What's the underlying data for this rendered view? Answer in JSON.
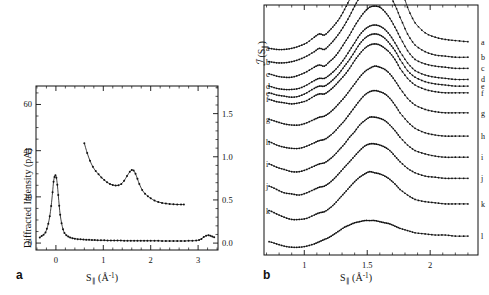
{
  "figure": {
    "panels": [
      {
        "letter": "a",
        "xlabel_main": "S",
        "xlabel_sub": "∥",
        "xlabel_unit_open": " (Å",
        "xlabel_unit_sup": "-1",
        "xlabel_unit_close": ")",
        "ylabel_left": "Diffracted Intensity (pA)",
        "xticks": [
          "0",
          "1",
          "2",
          "3"
        ],
        "yticks_left": [
          "0",
          "20",
          "40",
          "60"
        ],
        "yticks_right": [
          "0.0",
          "0.5",
          "1.0",
          "1.5"
        ]
      },
      {
        "letter": "b",
        "xlabel_main": "S",
        "xlabel_sub": "∥",
        "xlabel_unit_open": " (Å",
        "xlabel_unit_sup": "-1",
        "xlabel_unit_close": ")",
        "ylabel_main": "ℐ",
        "ylabel_arg_open": " (S",
        "ylabel_arg_sub": "∥",
        "ylabel_arg_close": ")",
        "xticks": [
          "1",
          "1.5",
          "2"
        ],
        "curve_labels": [
          "a",
          "b",
          "c",
          "d",
          "e",
          "f",
          "g",
          "h",
          "i",
          "j",
          "k",
          "l"
        ]
      }
    ],
    "colors": {
      "ink": "#111111",
      "background": "#ffffff"
    }
  },
  "chart_data": [
    {
      "type": "line",
      "panel": "a",
      "title": "",
      "xlabel": "S_par (A^-1)",
      "ylabel": "Diffracted Intensity (pA)",
      "ylabel_right": "Diffracted Intensity (arb.)",
      "xlim": [
        -0.42,
        3.42
      ],
      "ylim": [
        -3,
        68
      ],
      "ylim_right": [
        -0.08,
        1.82
      ],
      "xticks": [
        0,
        1,
        2,
        3
      ],
      "yticks": [
        0,
        20,
        40,
        60
      ],
      "yticks_right": [
        0.0,
        0.5,
        1.0,
        1.5
      ],
      "grid": false,
      "legend": "none",
      "markers": "filled-dot",
      "series": [
        {
          "name": "specular-scan-low",
          "axis": "left",
          "x": [
            -0.34,
            -0.3,
            -0.26,
            -0.22,
            -0.19,
            -0.16,
            -0.13,
            -0.1,
            -0.07,
            -0.05,
            -0.03,
            -0.01,
            0.01,
            0.03,
            0.05,
            0.07,
            0.09,
            0.12,
            0.15,
            0.18,
            0.22,
            0.26,
            0.3,
            0.35,
            0.4,
            0.46,
            0.52,
            0.58,
            0.64,
            0.7,
            0.76,
            0.82,
            0.88,
            0.95,
            1.02,
            1.09,
            1.16,
            1.23,
            1.3,
            1.37,
            1.44,
            1.51,
            1.58,
            1.65,
            1.72,
            1.79,
            1.86,
            1.93,
            2.0,
            2.08,
            2.16,
            2.24,
            2.32,
            2.4,
            2.48,
            2.56,
            2.64,
            2.72,
            2.8,
            2.88,
            2.96,
            3.02,
            3.07,
            3.12,
            3.17,
            3.22,
            3.26,
            3.3,
            3.34
          ],
          "y": [
            2.4,
            3.1,
            3.6,
            4.6,
            6.2,
            8.4,
            11.6,
            16.1,
            22.0,
            26.5,
            28.6,
            29.4,
            28.3,
            25.3,
            20.8,
            16.2,
            12.3,
            8.6,
            6.0,
            4.4,
            3.4,
            2.8,
            2.4,
            2.1,
            1.9,
            1.7,
            1.6,
            1.5,
            1.4,
            1.4,
            1.3,
            1.3,
            1.2,
            1.2,
            1.2,
            1.1,
            1.1,
            1.1,
            1.1,
            1.1,
            1.0,
            1.0,
            1.0,
            1.0,
            1.0,
            1.0,
            1.0,
            1.0,
            1.0,
            1.0,
            1.0,
            0.9,
            0.9,
            0.9,
            0.9,
            0.9,
            0.9,
            0.9,
            1.0,
            1.0,
            1.1,
            1.3,
            1.8,
            2.6,
            3.2,
            3.4,
            3.2,
            2.8,
            2.5
          ]
        },
        {
          "name": "diffuse-scan-high",
          "axis": "right",
          "x": [
            0.6,
            0.66,
            0.72,
            0.78,
            0.84,
            0.9,
            0.96,
            1.02,
            1.08,
            1.14,
            1.2,
            1.26,
            1.32,
            1.38,
            1.44,
            1.5,
            1.56,
            1.6,
            1.64,
            1.68,
            1.72,
            1.76,
            1.82,
            1.88,
            1.94,
            2.0,
            2.08,
            2.16,
            2.24,
            2.32,
            2.4,
            2.48,
            2.56,
            2.64,
            2.7
          ],
          "y_pA_equiv": [
            43.2,
            39.0,
            35.6,
            33.0,
            31.2,
            29.8,
            28.4,
            27.3,
            26.3,
            25.6,
            25.1,
            24.9,
            25.0,
            25.6,
            27.0,
            29.0,
            30.9,
            31.6,
            31.4,
            30.0,
            27.8,
            25.6,
            23.0,
            21.4,
            20.3,
            19.4,
            18.4,
            17.8,
            17.4,
            17.1,
            16.9,
            16.8,
            16.7,
            16.7,
            16.7
          ]
        }
      ]
    },
    {
      "type": "line",
      "panel": "b",
      "title": "",
      "xlabel": "S_par (A^-1)",
      "ylabel": "I(S_par)",
      "xlim": [
        0.68,
        2.38
      ],
      "ylim": [
        -0.1,
        2.15
      ],
      "xticks": [
        1,
        1.5,
        2
      ],
      "grid": false,
      "legend": "right-of-curve-ends",
      "markers": "filled-dot",
      "note": "Twelve vertically-offset structure-factor curves a(top) through l(bottom); each has a broad peak near S=1.55-1.68.",
      "x": [
        0.72,
        0.78,
        0.84,
        0.9,
        0.96,
        1.02,
        1.08,
        1.12,
        1.16,
        1.2,
        1.24,
        1.28,
        1.32,
        1.36,
        1.4,
        1.44,
        1.48,
        1.52,
        1.56,
        1.6,
        1.64,
        1.68,
        1.72,
        1.76,
        1.82,
        1.88,
        1.96,
        2.04,
        2.12,
        2.2,
        2.3
      ],
      "series": [
        {
          "name": "a",
          "offset": 1.72,
          "peak_x": 1.67,
          "peak_height": 0.92,
          "values": [
            1.76,
            1.75,
            1.75,
            1.76,
            1.78,
            1.81,
            1.86,
            1.89,
            1.88,
            1.92,
            1.97,
            2.03,
            2.11,
            2.2,
            2.3,
            2.4,
            2.5,
            2.58,
            2.63,
            2.65,
            2.64,
            2.58,
            2.48,
            2.34,
            2.13,
            1.99,
            1.9,
            1.86,
            1.84,
            1.83,
            1.82
          ]
        },
        {
          "name": "b",
          "offset": 1.6,
          "peak_x": 1.66,
          "peak_height": 0.74,
          "values": [
            1.64,
            1.63,
            1.63,
            1.64,
            1.66,
            1.69,
            1.73,
            1.76,
            1.75,
            1.79,
            1.84,
            1.9,
            1.97,
            2.05,
            2.14,
            2.22,
            2.29,
            2.33,
            2.35,
            2.34,
            2.3,
            2.24,
            2.15,
            2.04,
            1.89,
            1.79,
            1.73,
            1.7,
            1.69,
            1.68,
            1.68
          ]
        },
        {
          "name": "c",
          "offset": 1.48,
          "peak_x": 1.64,
          "peak_height": 0.66,
          "values": [
            1.53,
            1.51,
            1.5,
            1.5,
            1.52,
            1.55,
            1.59,
            1.61,
            1.6,
            1.64,
            1.68,
            1.74,
            1.81,
            1.88,
            1.96,
            2.03,
            2.09,
            2.13,
            2.14,
            2.13,
            2.09,
            2.03,
            1.95,
            1.86,
            1.74,
            1.66,
            1.62,
            1.6,
            1.59,
            1.58,
            1.58
          ]
        },
        {
          "name": "d",
          "offset": 1.36,
          "peak_x": 1.62,
          "peak_height": 0.6,
          "values": [
            1.42,
            1.4,
            1.39,
            1.39,
            1.4,
            1.43,
            1.47,
            1.49,
            1.49,
            1.52,
            1.56,
            1.61,
            1.67,
            1.74,
            1.81,
            1.88,
            1.93,
            1.96,
            1.97,
            1.96,
            1.93,
            1.88,
            1.81,
            1.73,
            1.63,
            1.56,
            1.52,
            1.5,
            1.49,
            1.48,
            1.48
          ]
        },
        {
          "name": "e",
          "offset": 1.29,
          "peak_x": 1.61,
          "peak_height": 0.58,
          "values": [
            1.36,
            1.34,
            1.33,
            1.32,
            1.33,
            1.36,
            1.4,
            1.42,
            1.42,
            1.45,
            1.49,
            1.54,
            1.6,
            1.66,
            1.73,
            1.8,
            1.85,
            1.88,
            1.89,
            1.88,
            1.85,
            1.8,
            1.74,
            1.66,
            1.56,
            1.5,
            1.46,
            1.44,
            1.43,
            1.42,
            1.42
          ]
        },
        {
          "name": "f",
          "offset": 1.22,
          "peak_x": 1.6,
          "peak_height": 0.56,
          "values": [
            1.3,
            1.28,
            1.27,
            1.26,
            1.27,
            1.29,
            1.33,
            1.35,
            1.35,
            1.38,
            1.42,
            1.47,
            1.52,
            1.58,
            1.65,
            1.71,
            1.76,
            1.79,
            1.8,
            1.79,
            1.76,
            1.72,
            1.66,
            1.58,
            1.49,
            1.43,
            1.39,
            1.37,
            1.36,
            1.36,
            1.36
          ]
        },
        {
          "name": "g",
          "offset": 1.06,
          "peak_x": 1.58,
          "peak_height": 0.54,
          "values": [
            1.12,
            1.1,
            1.08,
            1.07,
            1.07,
            1.09,
            1.12,
            1.14,
            1.15,
            1.18,
            1.22,
            1.27,
            1.32,
            1.38,
            1.44,
            1.5,
            1.55,
            1.58,
            1.6,
            1.59,
            1.57,
            1.53,
            1.47,
            1.4,
            1.31,
            1.25,
            1.21,
            1.19,
            1.18,
            1.18,
            1.18
          ]
        },
        {
          "name": "h",
          "offset": 0.86,
          "peak_x": 1.57,
          "peak_height": 0.52,
          "values": [
            0.92,
            0.89,
            0.87,
            0.86,
            0.86,
            0.88,
            0.91,
            0.93,
            0.94,
            0.97,
            1.01,
            1.06,
            1.11,
            1.17,
            1.23,
            1.29,
            1.34,
            1.37,
            1.38,
            1.37,
            1.35,
            1.31,
            1.25,
            1.18,
            1.1,
            1.04,
            1.0,
            0.98,
            0.97,
            0.97,
            0.97
          ]
        },
        {
          "name": "i",
          "offset": 0.66,
          "peak_x": 1.56,
          "peak_height": 0.48,
          "values": [
            0.72,
            0.69,
            0.67,
            0.65,
            0.65,
            0.67,
            0.7,
            0.72,
            0.73,
            0.76,
            0.8,
            0.85,
            0.9,
            0.96,
            1.01,
            1.07,
            1.11,
            1.14,
            1.14,
            1.13,
            1.11,
            1.07,
            1.02,
            0.96,
            0.89,
            0.84,
            0.81,
            0.79,
            0.78,
            0.78,
            0.78
          ]
        },
        {
          "name": "j",
          "offset": 0.45,
          "peak_x": 1.55,
          "peak_height": 0.45,
          "values": [
            0.52,
            0.49,
            0.46,
            0.45,
            0.44,
            0.46,
            0.49,
            0.51,
            0.52,
            0.55,
            0.59,
            0.64,
            0.69,
            0.74,
            0.79,
            0.84,
            0.88,
            0.9,
            0.9,
            0.89,
            0.87,
            0.84,
            0.79,
            0.74,
            0.68,
            0.64,
            0.61,
            0.6,
            0.59,
            0.59,
            0.59
          ]
        },
        {
          "name": "k",
          "offset": 0.22,
          "peak_x": 1.54,
          "peak_height": 0.42,
          "values": [
            0.3,
            0.27,
            0.24,
            0.22,
            0.22,
            0.23,
            0.26,
            0.28,
            0.29,
            0.32,
            0.36,
            0.41,
            0.46,
            0.51,
            0.56,
            0.6,
            0.63,
            0.65,
            0.64,
            0.63,
            0.61,
            0.58,
            0.54,
            0.49,
            0.44,
            0.4,
            0.38,
            0.37,
            0.36,
            0.36,
            0.36
          ]
        },
        {
          "name": "l",
          "offset": -0.02,
          "peak_x": 1.53,
          "peak_height": 0.22,
          "values": [
            0.02,
            0.0,
            -0.02,
            -0.03,
            -0.03,
            -0.02,
            0.0,
            0.02,
            0.04,
            0.06,
            0.09,
            0.12,
            0.15,
            0.17,
            0.19,
            0.2,
            0.21,
            0.21,
            0.21,
            0.2,
            0.19,
            0.18,
            0.16,
            0.14,
            0.12,
            0.1,
            0.09,
            0.08,
            0.08,
            0.07,
            0.07
          ]
        }
      ]
    }
  ]
}
